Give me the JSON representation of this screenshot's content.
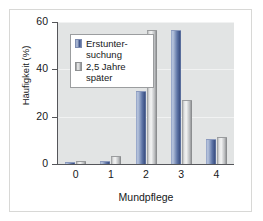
{
  "chart_data": {
    "type": "bar",
    "title": "",
    "xlabel": "Mundpflege",
    "ylabel": "Häufigkeit (%)",
    "categories": [
      "0",
      "1",
      "2",
      "3",
      "4"
    ],
    "series": [
      {
        "name": "Erstunter-suchung",
        "values": [
          0.5,
          1.0,
          30.5,
          56.0,
          10.0
        ],
        "color": "#4a5f8e"
      },
      {
        "name": "2,5 Jahre später",
        "values": [
          1.0,
          3.0,
          56.0,
          26.5,
          11.0
        ],
        "color": "#c9cbcd"
      }
    ],
    "ylim": [
      0,
      60
    ],
    "yticks": [
      0,
      20,
      40,
      60
    ],
    "ytick_labels": [
      "0",
      "20",
      "40",
      "60"
    ],
    "grid": true,
    "legend_position": "upper-left",
    "legend_entries": [
      {
        "label_line1": "Erstunter-",
        "label_line2": "suchung"
      },
      {
        "label_line1": "2,5 Jahre später",
        "label_line2": ""
      }
    ]
  },
  "colors": {
    "plot_background": "#e2e4e4",
    "gridline": "#f1f2f2",
    "axis": "#55565a",
    "series_blue": "#4a5f8e",
    "series_gray": "#c9cbcd",
    "card_border": "#d8d8d6",
    "text": "#16181a"
  }
}
